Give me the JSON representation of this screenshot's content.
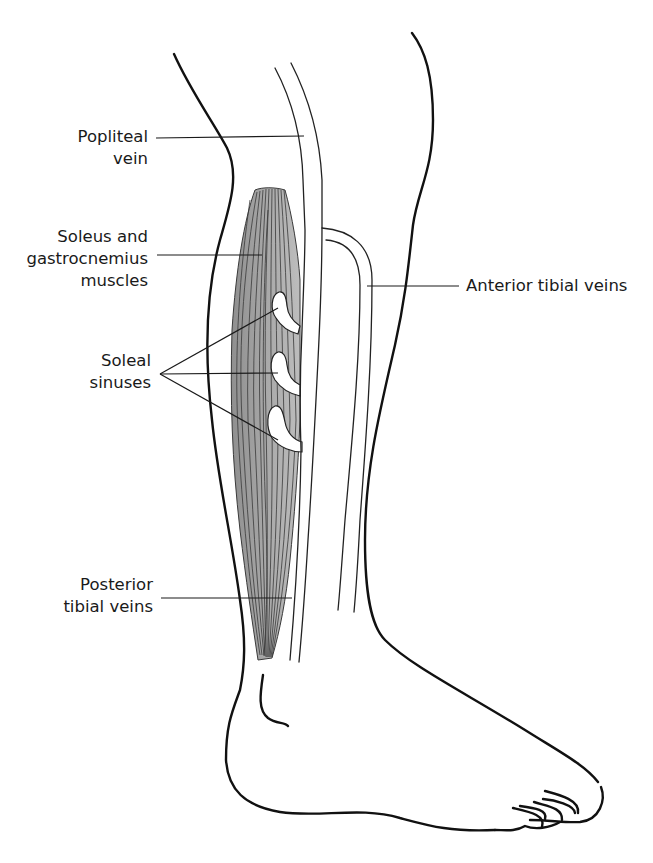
{
  "figure": {
    "colors": {
      "background": "#ffffff",
      "outline": "#111111",
      "muscle_fill": "#9a9a9a",
      "muscle_fiber": "#3a3a3a",
      "label_text": "#1a1a1a"
    }
  },
  "labels": {
    "popliteal_vein": {
      "line1": "Popliteal",
      "line2": "vein"
    },
    "soleus_gastrocnemius": {
      "line1": "Soleus and",
      "line2": "gastrocnemius",
      "line3": "muscles"
    },
    "soleal_sinuses": {
      "line1": "Soleal",
      "line2": "sinuses"
    },
    "posterior_tibial_veins": {
      "line1": "Posterior",
      "line2": "tibial veins"
    },
    "anterior_tibial_veins": {
      "line1": "Anterior tibial veins"
    }
  }
}
